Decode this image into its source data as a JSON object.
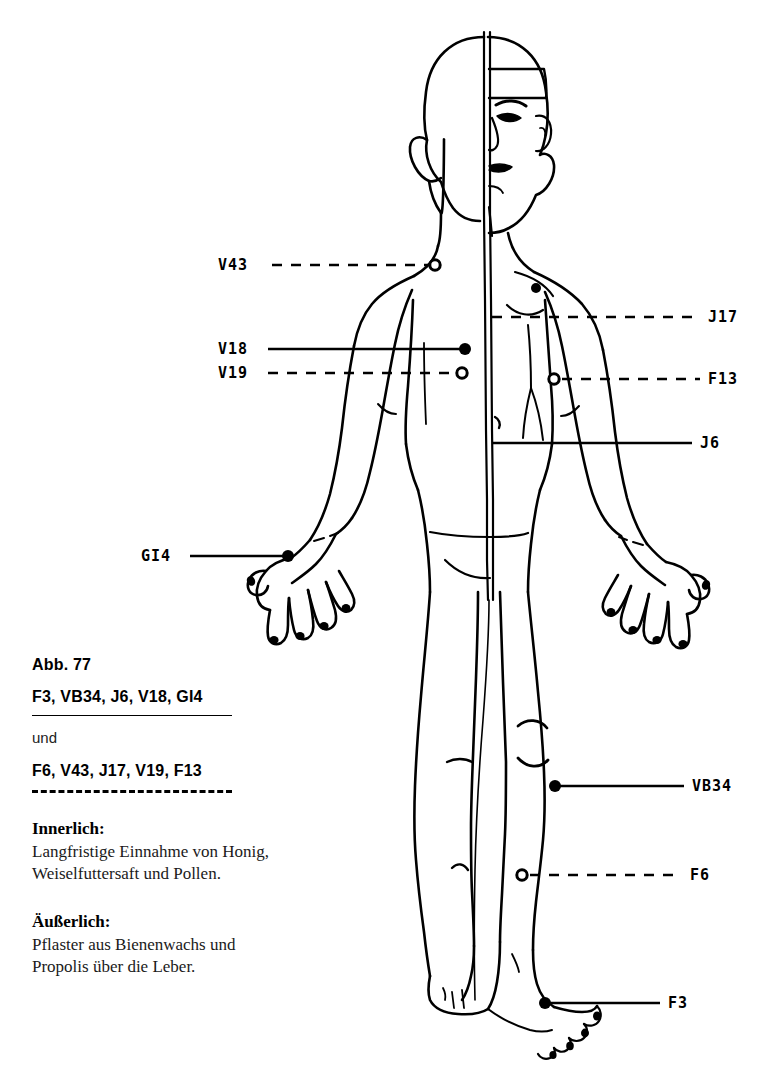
{
  "figure": {
    "line_color": "#000000"
  },
  "point_labels": {
    "left": [
      {
        "id": "v43",
        "text": "V43",
        "line_style": "dashed",
        "marker": "open",
        "x": 218,
        "y": 258
      },
      {
        "id": "v18",
        "text": "V18",
        "line_style": "solid",
        "marker": "filled",
        "x": 218,
        "y": 342
      },
      {
        "id": "v19",
        "text": "V19",
        "line_style": "dashed",
        "marker": "open",
        "x": 218,
        "y": 366
      },
      {
        "id": "gi4",
        "text": "GI4",
        "line_style": "solid",
        "marker": "filled",
        "x": 141,
        "y": 549
      }
    ],
    "right": [
      {
        "id": "j17",
        "text": "J17",
        "line_style": "dashed",
        "marker": "none",
        "x": 708,
        "y": 310
      },
      {
        "id": "f13",
        "text": "F13",
        "line_style": "dashed",
        "marker": "open",
        "x": 708,
        "y": 374
      },
      {
        "id": "j6",
        "text": "J6",
        "line_style": "solid",
        "marker": "none",
        "x": 700,
        "y": 440
      },
      {
        "id": "vb34",
        "text": "VB34",
        "line_style": "solid",
        "marker": "filled",
        "x": 692,
        "y": 786
      },
      {
        "id": "f6",
        "text": "F6",
        "line_style": "dashed",
        "marker": "open",
        "x": 690,
        "y": 875
      },
      {
        "id": "f3",
        "text": "F3",
        "line_style": "solid",
        "marker": "filled",
        "x": 668,
        "y": 1003
      }
    ]
  },
  "caption": {
    "abb": "Abb. 77",
    "points_solid": "F3, VB34, J6, V18, GI4",
    "und": "und",
    "points_dashed": "F6, V43, J17, V19, F13"
  },
  "sections": [
    {
      "id": "innerlich",
      "heading": "Innerlich:",
      "lines": [
        "Langfristige Einnahme von Honig,",
        "Weiselfuttersaft und Pollen."
      ]
    },
    {
      "id": "aeusserlich",
      "heading": "Äußerlich:",
      "lines": [
        "Pflaster aus Bienenwachs und",
        "Propolis über die Leber."
      ]
    }
  ]
}
